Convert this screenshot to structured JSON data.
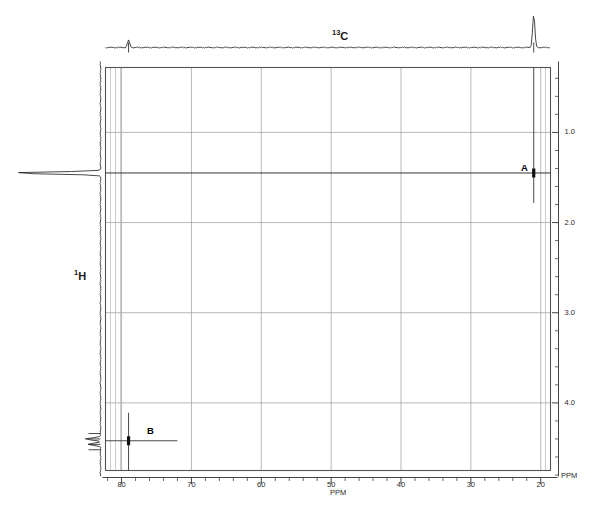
{
  "figure": {
    "background": "#ffffff",
    "width": 602,
    "height": 507
  },
  "labels": {
    "f2_nucleus_sup": "13",
    "f2_nucleus_base": "C",
    "f1_nucleus_sup": "1",
    "f1_nucleus_base": "H",
    "x_axis_unit": "PPM",
    "x_axis_unit_right": "PPM",
    "y_axis_unit": "PPM",
    "peak_a": "A",
    "peak_b": "B"
  },
  "colors": {
    "frame": "#555555",
    "grid": "#999999",
    "trace": "#1a1a1a",
    "ridge": "#2a2a2a",
    "text": "#1a1a1a",
    "axis": "#444444"
  },
  "chart_data": {
    "type": "heatmap",
    "xlabel": "PPM",
    "ylabel": "PPM",
    "x_nucleus": "13C",
    "y_nucleus": "1H",
    "xlim": [
      82.3,
      18.6
    ],
    "ylim": [
      0.28,
      4.75
    ],
    "x_axis_reversed": true,
    "y_axis_reversed": true,
    "grid": true,
    "xticks_major": [
      80,
      70,
      60,
      50,
      40,
      30,
      20
    ],
    "xticks_minor_step": 2,
    "yticks_major": [
      1.0,
      2.0,
      3.0,
      4.0
    ],
    "yticks_minor_step": 0.2,
    "x_gridlines": [
      80,
      70,
      60,
      50,
      40,
      30,
      20
    ],
    "y_gridlines": [
      1.0,
      2.0,
      3.0,
      4.0
    ],
    "cross_peaks": [
      {
        "label": "A",
        "x": 21.0,
        "y": 1.45,
        "intensity": "strong"
      },
      {
        "label": "B",
        "x": 79.0,
        "y": 4.42,
        "intensity": "strong"
      }
    ],
    "f2_projection": {
      "name": "13C 1D projection (top)",
      "peaks": [
        {
          "ppm": 79.0,
          "height": 0.22
        },
        {
          "ppm": 21.0,
          "height": 1.0
        }
      ]
    },
    "f1_projection": {
      "name": "1H 1D projection (left)",
      "peaks": [
        {
          "ppm": 1.45,
          "height": 1.0
        },
        {
          "ppm": 4.4,
          "height": 0.18
        },
        {
          "ppm": 4.46,
          "height": 0.14
        }
      ]
    },
    "annotations": [
      {
        "text": "A",
        "x": 21.0,
        "y": 1.72
      },
      {
        "text": "B",
        "x": 75.5,
        "y": 4.22
      }
    ]
  },
  "xtick_labels": [
    {
      "value": 80,
      "text": "80"
    },
    {
      "value": 70,
      "text": "70"
    },
    {
      "value": 60,
      "text": "60"
    },
    {
      "value": 50,
      "text": "50"
    },
    {
      "value": 40,
      "text": "40"
    },
    {
      "value": 30,
      "text": "30"
    },
    {
      "value": 20,
      "text": "20"
    }
  ],
  "ytick_labels": [
    {
      "value": 1.0,
      "text": "1.0"
    },
    {
      "value": 2.0,
      "text": "2.0"
    },
    {
      "value": 3.0,
      "text": "3.0"
    },
    {
      "value": 4.0,
      "text": "4.0"
    }
  ]
}
